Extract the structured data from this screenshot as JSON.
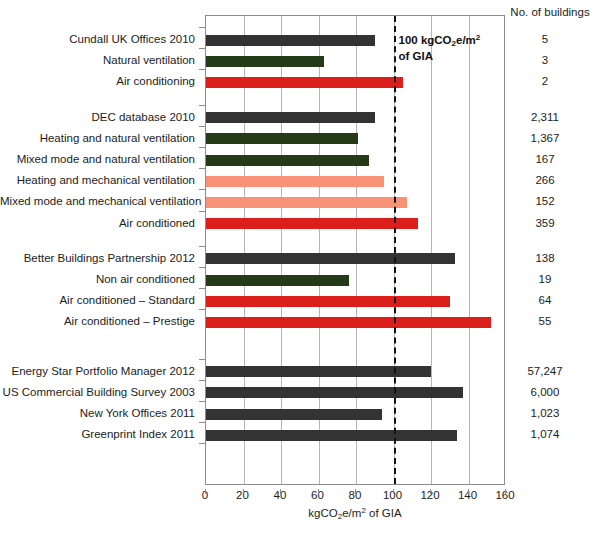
{
  "header": {
    "counts_column_title": "No. of buildings"
  },
  "annotation": {
    "line1_prefix": "100 kgCO",
    "line1_sub": "2",
    "line1_suffix": "e/m",
    "line1_sup": "2",
    "line2": "of GIA",
    "threshold_value": 100
  },
  "axis": {
    "title_prefix": "kgCO",
    "title_sub": "2",
    "title_mid": "e/m",
    "title_sup": "2",
    "title_suffix": " of GIA",
    "ticks": [
      0,
      20,
      40,
      60,
      80,
      100,
      120,
      140,
      160
    ],
    "min": 0,
    "max": 160
  },
  "colors": {
    "dark_grey": "#333333",
    "dark_green": "#253B17",
    "red": "#DD1F1B",
    "salmon": "#F79276",
    "gridline": "#b5b5b5",
    "axis": "#8c8c8c",
    "text": "#1c1c1c"
  },
  "caption": "",
  "chart_data": {
    "type": "bar",
    "orientation": "horizontal",
    "title": "",
    "xlabel": "kgCO2e/m2 of GIA",
    "ylabel": "",
    "xlim": [
      0,
      160
    ],
    "grid": true,
    "legend": "none",
    "annotations": [
      {
        "type": "vline",
        "value": 100,
        "style": "dashed",
        "label": "100 kgCO2e/m2 of GIA"
      }
    ],
    "extra_column": {
      "name": "No. of buildings",
      "values": [
        "5",
        "3",
        "2",
        "2,311",
        "1,367",
        "167",
        "266",
        "152",
        "359",
        "138",
        "19",
        "64",
        "55",
        "57,247",
        "6,000",
        "1,023",
        "1,074"
      ]
    },
    "groups": [
      {
        "name": "Cundall UK Offices 2010",
        "rows": [
          {
            "label": "Cundall UK Offices 2010",
            "value": 90,
            "color": "dark_grey",
            "buildings": "5"
          },
          {
            "label": "Natural ventilation",
            "value": 63,
            "color": "dark_green",
            "buildings": "3"
          },
          {
            "label": "Air conditioning",
            "value": 105,
            "color": "red",
            "buildings": "2"
          }
        ]
      },
      {
        "name": "DEC database 2010",
        "rows": [
          {
            "label": "DEC database 2010",
            "value": 90,
            "color": "dark_grey",
            "buildings": "2,311"
          },
          {
            "label": "Heating and natural ventilation",
            "value": 81,
            "color": "dark_green",
            "buildings": "1,367"
          },
          {
            "label": "Mixed mode and natural ventilation",
            "value": 87,
            "color": "dark_green",
            "buildings": "167"
          },
          {
            "label": "Heating and mechanical ventilation",
            "value": 95,
            "color": "salmon",
            "buildings": "266"
          },
          {
            "label": "Mixed mode and mechanical ventilation",
            "value": 107,
            "color": "salmon",
            "buildings": "152"
          },
          {
            "label": "Air conditioned",
            "value": 113,
            "color": "red",
            "buildings": "359"
          }
        ]
      },
      {
        "name": "Better Buildings Partnership 2012",
        "rows": [
          {
            "label": "Better Buildings Partnership 2012",
            "value": 133,
            "color": "dark_grey",
            "buildings": "138"
          },
          {
            "label": "Non air conditioned",
            "value": 76,
            "color": "dark_green",
            "buildings": "19"
          },
          {
            "label": "Air conditioned – Standard",
            "value": 130,
            "color": "red",
            "buildings": "64"
          },
          {
            "label": "Air conditioned – Prestige",
            "value": 152,
            "color": "red",
            "buildings": "55"
          }
        ]
      },
      {
        "name": "US / Greenprint",
        "rows": [
          {
            "label": "Energy Star Portfolio Manager 2012",
            "value": 120,
            "color": "dark_grey",
            "buildings": "57,247"
          },
          {
            "label": "US Commercial Building Survey 2003",
            "value": 137,
            "color": "dark_grey",
            "buildings": "6,000"
          },
          {
            "label": "New York Offices 2011",
            "value": 94,
            "color": "dark_grey",
            "buildings": "1,023"
          },
          {
            "label": "Greenprint Index 2011",
            "value": 134,
            "color": "dark_grey",
            "buildings": "1,074"
          }
        ]
      }
    ]
  }
}
